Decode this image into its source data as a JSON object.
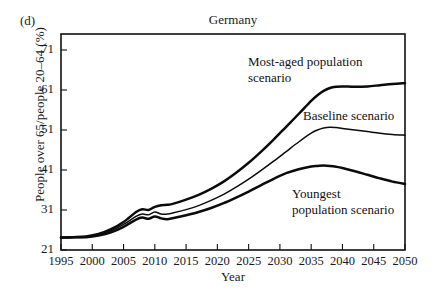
{
  "panel": {
    "label": "(d)"
  },
  "chart_data": {
    "type": "line",
    "title": "Germany",
    "xlabel": "Year",
    "ylabel": "People over 65/people 20–64 (%)",
    "grid": false,
    "legend_position": "inline-annotations",
    "xlim": [
      1995,
      2050
    ],
    "ylim": [
      21,
      75
    ],
    "xticks": [
      1995,
      2000,
      2005,
      2010,
      2015,
      2020,
      2025,
      2030,
      2035,
      2040,
      2045,
      2050
    ],
    "xtick_labels": [
      "1995",
      "2000",
      "2005",
      "2010",
      "2015",
      "2020",
      "2025",
      "2030",
      "2035",
      "2040",
      "2045",
      "2050"
    ],
    "yticks": [
      21,
      31,
      41,
      51,
      61,
      71
    ],
    "ytick_labels": [
      "21",
      "31",
      "41",
      "51",
      "61",
      "71"
    ],
    "x": [
      1995,
      1997,
      1999,
      2001,
      2003,
      2005,
      2007,
      2008,
      2009,
      2010,
      2011,
      2012,
      2013,
      2015,
      2017,
      2019,
      2021,
      2023,
      2025,
      2027,
      2029,
      2031,
      2033,
      2035,
      2036,
      2037,
      2038,
      2039,
      2040,
      2042,
      2044,
      2046,
      2048,
      2050
    ],
    "series": [
      {
        "name": "Most-aged population scenario",
        "values": [
          24.1,
          24.2,
          24.4,
          25.0,
          26.2,
          28.0,
          30.5,
          31.2,
          31.0,
          31.8,
          32.2,
          32.3,
          32.6,
          33.6,
          34.8,
          36.3,
          38.1,
          40.3,
          42.8,
          45.6,
          48.6,
          51.8,
          55.0,
          58.3,
          59.7,
          60.8,
          61.5,
          61.8,
          61.9,
          61.8,
          61.9,
          62.2,
          62.5,
          62.7
        ]
      },
      {
        "name": "Baseline scenario",
        "values": [
          24.1,
          24.2,
          24.3,
          24.8,
          25.8,
          27.4,
          29.4,
          30.0,
          29.8,
          30.5,
          30.0,
          30.0,
          30.3,
          31.1,
          32.1,
          33.4,
          34.9,
          36.7,
          38.7,
          40.9,
          43.2,
          45.6,
          48.0,
          50.2,
          51.0,
          51.5,
          51.7,
          51.6,
          51.4,
          51.0,
          50.6,
          50.2,
          49.9,
          49.7
        ]
      },
      {
        "name": "Youngest population scenario",
        "values": [
          24.1,
          24.2,
          24.2,
          24.6,
          25.4,
          26.8,
          28.6,
          29.1,
          28.8,
          29.4,
          28.9,
          28.7,
          29.0,
          29.7,
          30.5,
          31.5,
          32.7,
          34.1,
          35.6,
          37.2,
          38.8,
          40.2,
          41.2,
          41.9,
          42.0,
          42.1,
          42.0,
          41.8,
          41.5,
          40.7,
          39.8,
          38.9,
          38.1,
          37.5
        ]
      }
    ],
    "annotations": [
      {
        "id": "most-aged",
        "lines": [
          "Most-aged population",
          "scenario"
        ],
        "x": 248,
        "y": 66
      },
      {
        "id": "baseline",
        "lines": [
          "Baseline scenario"
        ],
        "x": 303,
        "y": 120
      },
      {
        "id": "youngest",
        "lines": [
          "Youngest",
          "population scenario"
        ],
        "x": 292,
        "y": 198
      }
    ]
  }
}
